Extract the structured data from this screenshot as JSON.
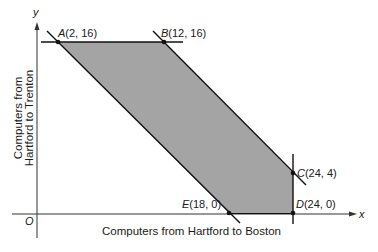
{
  "diagram": {
    "type": "feasible-region",
    "axes": {
      "x_symbol": "x",
      "y_symbol": "y",
      "origin_label": "O",
      "x_label": "Computers from Hartford to Boston",
      "y_label_line1": "Computers from",
      "y_label_line2": "Hartford to Trenton"
    },
    "points": [
      {
        "letter": "A",
        "coords": "(2, 16)"
      },
      {
        "letter": "B",
        "coords": "(12, 16)"
      },
      {
        "letter": "C",
        "coords": "(24, 4)"
      },
      {
        "letter": "D",
        "coords": "(24, 0)"
      },
      {
        "letter": "E",
        "coords": "(18, 0)"
      }
    ],
    "colors": {
      "region_fill": "#a4a4a4",
      "line": "#111111",
      "axis": "#333333"
    }
  }
}
